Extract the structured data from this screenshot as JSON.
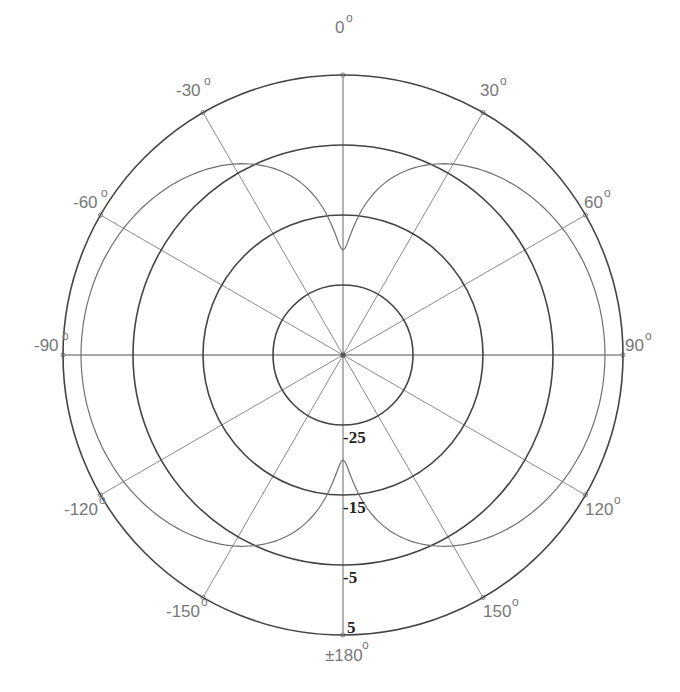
{
  "chart_data": {
    "type": "polar",
    "title": "",
    "center": {
      "x": 343,
      "y": 355
    },
    "radial_axis": {
      "unit": "dB",
      "range": [
        -35,
        5
      ],
      "ticks": [
        -25,
        -15,
        -5,
        5
      ],
      "tick_labels": [
        "-25",
        "-15",
        "-5",
        "5"
      ],
      "px_per_unit": 7
    },
    "angular_axis": {
      "unit": "degrees",
      "ticks": [
        0,
        30,
        60,
        90,
        120,
        150,
        180,
        -150,
        -120,
        -90,
        -60,
        -30
      ],
      "tick_labels": [
        "0",
        "30",
        "60",
        "90",
        "120",
        "150",
        "±180",
        "-150",
        "-120",
        "-90",
        "-60",
        "-30"
      ],
      "zero_at": "top",
      "direction": "clockwise"
    },
    "grid": true,
    "series": [
      {
        "name": "radiation pattern",
        "angles_deg": [
          0,
          15,
          30,
          45,
          60,
          75,
          90,
          105,
          120,
          135,
          150,
          165,
          180,
          195,
          210,
          225,
          240,
          255,
          270,
          285,
          300,
          315,
          330,
          345
        ],
        "values_db": [
          -20.0,
          -9.0,
          -3.5,
          -0.6,
          1.2,
          2.1,
          2.4,
          2.1,
          1.2,
          -0.6,
          -3.5,
          -9.0,
          -20.0,
          -9.0,
          -3.5,
          -0.6,
          1.2,
          2.1,
          2.4,
          2.1,
          1.2,
          -0.6,
          -3.5,
          -9.0
        ],
        "color": "#707070"
      }
    ]
  },
  "labels": {
    "a0": "0",
    "a30": "30",
    "a60": "60",
    "a90": "90",
    "a120": "120",
    "a150": "150",
    "a180": "±180",
    "am150": "-150",
    "am120": "-120",
    "am90": "-90",
    "am60": "-60",
    "am30": "-30",
    "deg_symbol": "o",
    "r1": "-25",
    "r2": "-15",
    "r3": "-5",
    "r4": "5"
  },
  "colors": {
    "ring": "#444444",
    "spoke": "#8a8a8a",
    "pattern": "#707070"
  }
}
